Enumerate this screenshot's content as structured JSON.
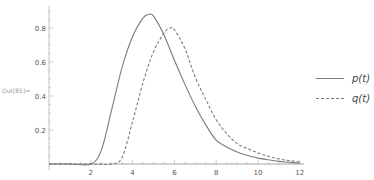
{
  "cell_label": "Out[85]=",
  "colors": {
    "p": "#7b7b7b",
    "q": "#7b7b7b",
    "axis": "#b0b0b0"
  },
  "legend": [
    {
      "label": "p(t)",
      "style": "solid"
    },
    {
      "label": "q(t)",
      "style": "dashed"
    }
  ],
  "chart_data": {
    "type": "line",
    "title": "",
    "xlabel": "",
    "ylabel": "",
    "xlim": [
      0,
      12
    ],
    "ylim": [
      0,
      0.9
    ],
    "x_ticks": [
      2,
      4,
      6,
      8,
      10,
      12
    ],
    "y_ticks": [
      0.2,
      0.4,
      0.6,
      0.8
    ],
    "grid": false,
    "legend_position": "right",
    "series": [
      {
        "name": "p(t)",
        "style": "solid",
        "x": [
          0,
          1,
          2,
          2.5,
          3,
          3.5,
          4,
          4.5,
          4.8,
          5,
          5.5,
          6,
          6.5,
          7,
          7.5,
          8,
          8.5,
          9,
          9.5,
          10,
          10.5,
          11,
          11.5,
          12
        ],
        "y": [
          0,
          0,
          0,
          0.08,
          0.32,
          0.57,
          0.75,
          0.86,
          0.88,
          0.87,
          0.76,
          0.61,
          0.47,
          0.34,
          0.23,
          0.14,
          0.1,
          0.07,
          0.05,
          0.035,
          0.025,
          0.015,
          0.01,
          0.005
        ]
      },
      {
        "name": "q(t)",
        "style": "dashed",
        "x": [
          0,
          1,
          2,
          3,
          3.5,
          4,
          4.5,
          5,
          5.5,
          5.8,
          6,
          6.5,
          7,
          7.5,
          8,
          8.5,
          9,
          9.5,
          10,
          10.5,
          11,
          11.5,
          12
        ],
        "y": [
          0,
          0,
          0,
          0,
          0.04,
          0.25,
          0.48,
          0.66,
          0.77,
          0.8,
          0.79,
          0.68,
          0.51,
          0.38,
          0.26,
          0.18,
          0.12,
          0.09,
          0.065,
          0.045,
          0.03,
          0.02,
          0.012
        ]
      }
    ]
  }
}
